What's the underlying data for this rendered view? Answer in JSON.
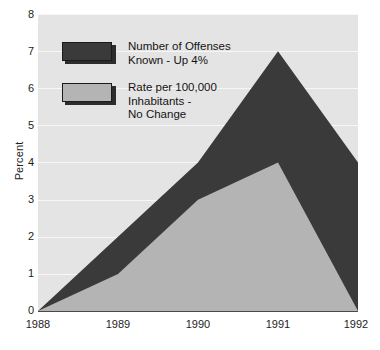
{
  "chart_data": {
    "type": "area",
    "title": "",
    "xlabel": "",
    "ylabel": "Percent",
    "categories": [
      "1988",
      "1989",
      "1990",
      "1991",
      "1992"
    ],
    "x": [
      1988,
      1989,
      1990,
      1991,
      1992
    ],
    "ylim": [
      0,
      8
    ],
    "xlim": [
      1988,
      1992
    ],
    "yticks": [
      0,
      1,
      2,
      3,
      4,
      5,
      6,
      7,
      8
    ],
    "grid": true,
    "grid_color": "#f7f7f7",
    "plot_background": "#e4e4e4",
    "legend_position": "upper-left-inside",
    "stacked": false,
    "series": [
      {
        "name": "Number of Offenses Known - Up 4%",
        "values": [
          0,
          2,
          4,
          7,
          4
        ],
        "color": "#3a3a3a"
      },
      {
        "name": "Rate per 100,000 Inhabitants - No Change",
        "values": [
          0,
          1,
          3,
          4,
          0
        ],
        "color": "#b4b4b4"
      }
    ]
  },
  "axes": {
    "ylabel": "Percent",
    "yticks": [
      "8",
      "7",
      "6",
      "5",
      "4",
      "3",
      "2",
      "1",
      "0"
    ],
    "xticks": [
      "1988",
      "1989",
      "1990",
      "1991",
      "1992"
    ]
  },
  "legend": {
    "items": [
      {
        "label": "Number of Offenses\nKnown - Up 4%",
        "color": "#3a3a3a"
      },
      {
        "label": "Rate per 100,000\nInhabitants -\nNo Change",
        "color": "#b4b4b4"
      }
    ]
  },
  "colors": {
    "dark_series": "#3a3a3a",
    "light_series": "#b4b4b4",
    "panel": "#e4e4e4",
    "gridline": "#f7f7f7",
    "axis": "#4a4a4a",
    "text": "#1d1d1d"
  }
}
